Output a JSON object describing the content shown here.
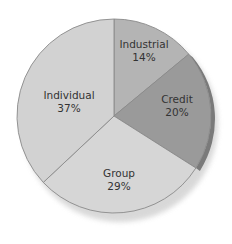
{
  "chart_data": {
    "type": "pie",
    "title": "",
    "start_angle_deg": 0,
    "direction": "clockwise",
    "categories": [
      "Industrial",
      "Credit",
      "Group",
      "Individual"
    ],
    "values": [
      14,
      20,
      29,
      37
    ],
    "unit": "%",
    "slices": [
      {
        "label": "Industrial",
        "value": 14,
        "display": "14%",
        "color": "#b4b4b4"
      },
      {
        "label": "Credit",
        "value": 20,
        "display": "20%",
        "color": "#9a9a9a"
      },
      {
        "label": "Group",
        "value": 29,
        "display": "29%",
        "color": "#d6d6d6"
      },
      {
        "label": "Individual",
        "value": 37,
        "display": "37%",
        "color": "#d2d2d2"
      }
    ],
    "legend": null,
    "labels_inside": true
  },
  "labels": {
    "industrial": {
      "name": "Industrial",
      "pct": "14%"
    },
    "credit": {
      "name": "Credit",
      "pct": "20%"
    },
    "group": {
      "name": "Group",
      "pct": "29%"
    },
    "individual": {
      "name": "Individual",
      "pct": "37%"
    }
  },
  "colors": {
    "edge": "#8a8a8a",
    "shadow": "#7a7a7a",
    "background": "#ffffff"
  }
}
